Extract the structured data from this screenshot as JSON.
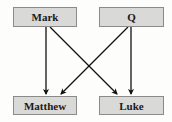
{
  "diagram": {
    "nodes": {
      "mark": {
        "label": "Mark"
      },
      "q": {
        "label": "Q"
      },
      "matthew": {
        "label": "Matthew"
      },
      "luke": {
        "label": "Luke"
      }
    },
    "edges": [
      {
        "from": "Mark",
        "to": "Matthew"
      },
      {
        "from": "Mark",
        "to": "Luke"
      },
      {
        "from": "Q",
        "to": "Matthew"
      },
      {
        "from": "Q",
        "to": "Luke"
      }
    ],
    "colors": {
      "box_fill": "#d9d9d7",
      "box_border": "#8a8a88",
      "arrow": "#111111"
    }
  }
}
